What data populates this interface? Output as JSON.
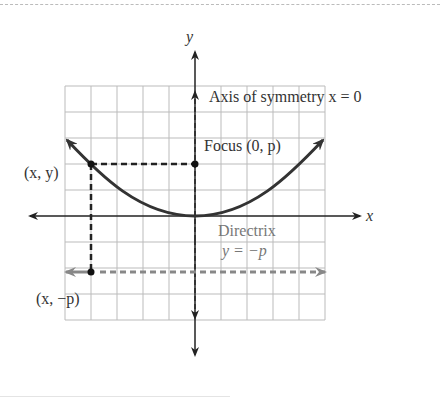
{
  "diagram": {
    "labels": {
      "y_axis": "y",
      "x_axis": "x",
      "axis_of_symmetry": "Axis of symmetry x = 0",
      "focus": "Focus (0, p)",
      "point": "(x, y)",
      "directrix_title": "Directrix",
      "directrix_eq": "y = −p",
      "projected_point": "(x, −p)"
    },
    "colors": {
      "curve": "#333333",
      "grid": "#bbbbbb",
      "directrix": "#888888",
      "axes": "#222222"
    }
  }
}
